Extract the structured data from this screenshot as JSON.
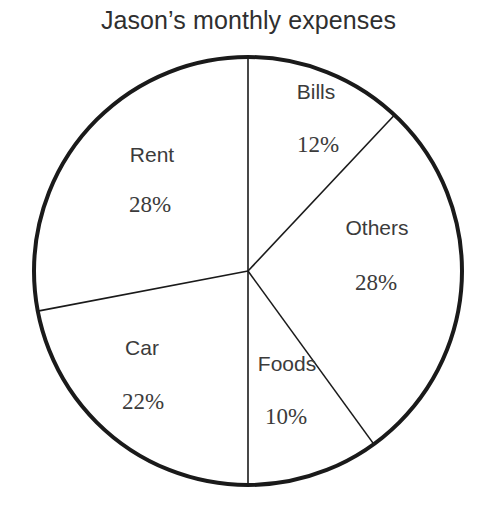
{
  "chart_data": {
    "type": "pie",
    "title": "Jason’s monthly expenses",
    "categories": [
      "Bills",
      "Others",
      "Foods",
      "Car",
      "Rent"
    ],
    "values": [
      12,
      28,
      10,
      22,
      28
    ],
    "value_labels": [
      "12%",
      "28%",
      "10%",
      "22%",
      "28%"
    ],
    "unit": "%",
    "total": 100,
    "start_angle_deg": 0,
    "direction": "clockwise",
    "legend": "none",
    "grid": false,
    "slice_fill": "#ffffff",
    "outline_color": "#1a1a1a",
    "text_color": "#3b3b3b",
    "background": "#ffffff",
    "slices": [
      {
        "name": "Bills",
        "value": 12,
        "label": "12%",
        "start_deg": 0,
        "end_deg": 43.2,
        "label_x": 316,
        "label_y": 92,
        "value_x": 318,
        "value_y": 145
      },
      {
        "name": "Others",
        "value": 28,
        "label": "28%",
        "start_deg": 43.2,
        "end_deg": 144,
        "label_x": 377,
        "label_y": 228,
        "value_x": 376,
        "value_y": 283
      },
      {
        "name": "Foods",
        "value": 10,
        "label": "10%",
        "start_deg": 144,
        "end_deg": 180,
        "label_x": 287,
        "label_y": 364,
        "value_x": 286,
        "value_y": 417
      },
      {
        "name": "Car",
        "value": 22,
        "label": "22%",
        "start_deg": 180,
        "end_deg": 259.2,
        "label_x": 142,
        "label_y": 348,
        "value_x": 143,
        "value_y": 402
      },
      {
        "name": "Rent",
        "value": 28,
        "label": "28%",
        "start_deg": 259.2,
        "end_deg": 360,
        "label_x": 152,
        "label_y": 155,
        "value_x": 150,
        "value_y": 205
      }
    ],
    "geometry": {
      "center_x": 248,
      "center_y": 271,
      "radius": 214,
      "outline_width": 4,
      "divider_width": 1.6
    }
  }
}
